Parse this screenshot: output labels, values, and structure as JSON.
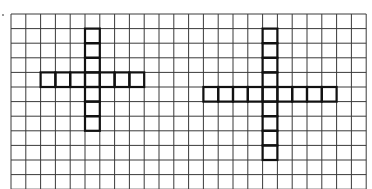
{
  "grid": {
    "cols": 24,
    "rows": 12,
    "cell_w": 14.8,
    "cell_h": 14.6,
    "line_color": "#3a3a3a",
    "highlight_color": "#111111"
  },
  "figures": [
    {
      "name": "left-cross",
      "vertical": {
        "col": 5,
        "row_start": 1,
        "row_end": 7
      },
      "horizontal": {
        "row": 4,
        "col_start": 2,
        "col_end": 8
      }
    },
    {
      "name": "right-cross",
      "vertical": {
        "col": 17,
        "row_start": 1,
        "row_end": 9
      },
      "horizontal": {
        "row": 5,
        "col_start": 13,
        "col_end": 21
      }
    }
  ]
}
